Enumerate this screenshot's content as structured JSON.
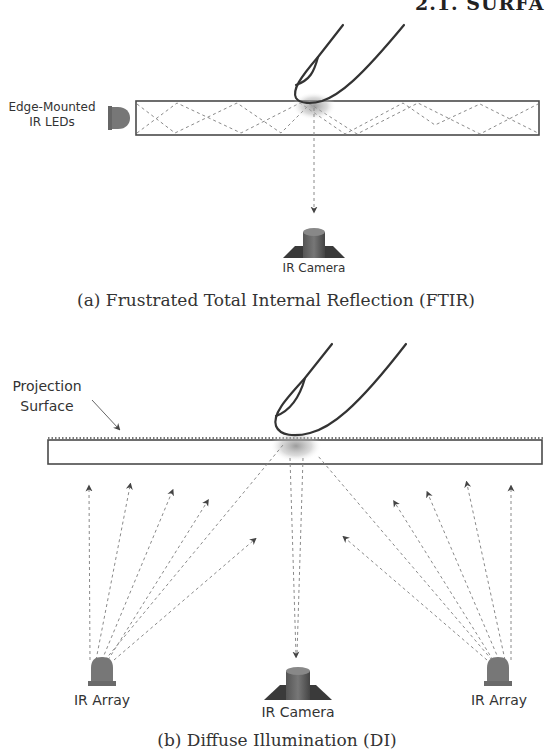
{
  "header": {
    "section_title": "2.1. SURFA"
  },
  "figure_a": {
    "caption": "(a)  Frustrated Total Internal Reflection (FTIR)",
    "labels": {
      "leds": [
        "Edge-Mounted",
        "IR LEDs"
      ],
      "camera": "IR Camera"
    }
  },
  "figure_b": {
    "caption": "(b)  Diffuse Illumination (DI)",
    "labels": {
      "surface": [
        "Projection",
        "Surface"
      ],
      "left_array": "IR Array",
      "camera": "IR Camera",
      "right_array": "IR Array"
    }
  },
  "colors": {
    "line": "#4a4a4a",
    "dashed": "#8a8a8a",
    "device": "#6e6e6e",
    "glow": "#9a9a9a"
  }
}
